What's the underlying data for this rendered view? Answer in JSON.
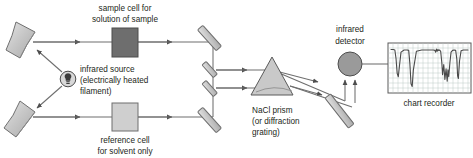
{
  "figure": {
    "background_color": "#ffffff",
    "outline_color": "#5a5a5a",
    "line_color": "#6e6e6e",
    "text_color": "#231f20"
  },
  "labels": {
    "sample_cell_line1": "sample cell for",
    "sample_cell_line2": "solution of sample",
    "source_line1": "infrared source",
    "source_line2": "(electrically heated",
    "source_line3": "filament)",
    "reference_cell_line1": "reference cell",
    "reference_cell_line2": "for solvent only",
    "prism_line1": "NaCl prism",
    "prism_line2": "(or diffraction",
    "prism_line3": "grating)",
    "detector_line1": "infrared",
    "detector_line2": "detector",
    "chart_recorder": "chart recorder"
  },
  "components": {
    "sample_cell": {
      "name": "sample-cell",
      "fill": "#6e6e6e",
      "stroke": "#4d4d4d"
    },
    "reference_cell": {
      "name": "reference-cell",
      "fill": "#cfcfcf",
      "stroke": "#6e6e6e"
    },
    "prism": {
      "name": "nacl-prism",
      "fill": "#c9c9c9",
      "stroke": "#5a5a5a"
    },
    "detector": {
      "name": "infrared-detector",
      "fill": "#9a9a9a",
      "stroke": "#4d4d4d"
    },
    "source_lamp": {
      "name": "infrared-source-lamp",
      "fill": "#d8d8d8",
      "stroke": "#4d4d4d"
    },
    "mirror": {
      "fill": "#d6d6d6",
      "stroke": "#6e6e6e"
    },
    "chart_paper": {
      "fill": "#ffffff",
      "grid": "#b9c6c2",
      "stroke": "#5a5a5a",
      "trace": "#4a4a4a"
    }
  },
  "chart_data": {
    "type": "line",
    "title": "chart recorder",
    "xlabel": "",
    "ylabel": "",
    "grid": true,
    "xlim": [
      0,
      100
    ],
    "ylim": [
      0,
      100
    ],
    "series": [
      {
        "name": "infrared transmittance trace",
        "x": [
          0,
          3,
          5,
          6.5,
          8,
          9.5,
          11,
          13,
          17,
          21,
          23,
          24.5,
          26,
          27.5,
          29,
          33,
          40,
          48,
          55,
          57,
          58,
          59,
          60,
          61,
          62,
          63,
          64.5,
          66,
          67,
          68.5,
          70,
          71.5,
          73,
          74,
          75,
          76.5,
          78,
          80,
          82,
          84,
          85.5,
          86.5,
          87.5,
          89,
          91,
          94,
          97,
          100
        ],
        "y": [
          92,
          92,
          91,
          72,
          38,
          30,
          55,
          86,
          91,
          91,
          90,
          60,
          14,
          8,
          45,
          88,
          91,
          91,
          91,
          90,
          86,
          93,
          88,
          92,
          90,
          91,
          88,
          62,
          35,
          58,
          24,
          48,
          20,
          46,
          30,
          62,
          86,
          90,
          91,
          90,
          70,
          32,
          26,
          66,
          89,
          91,
          91,
          91
        ]
      }
    ]
  },
  "beams": {
    "sample_beam_label": "sample-beam-path",
    "reference_beam_label": "reference-beam-path",
    "dispersed_beam_label": "dispersed-beam-path",
    "signal_line_label": "detector-to-recorder-signal-line"
  }
}
